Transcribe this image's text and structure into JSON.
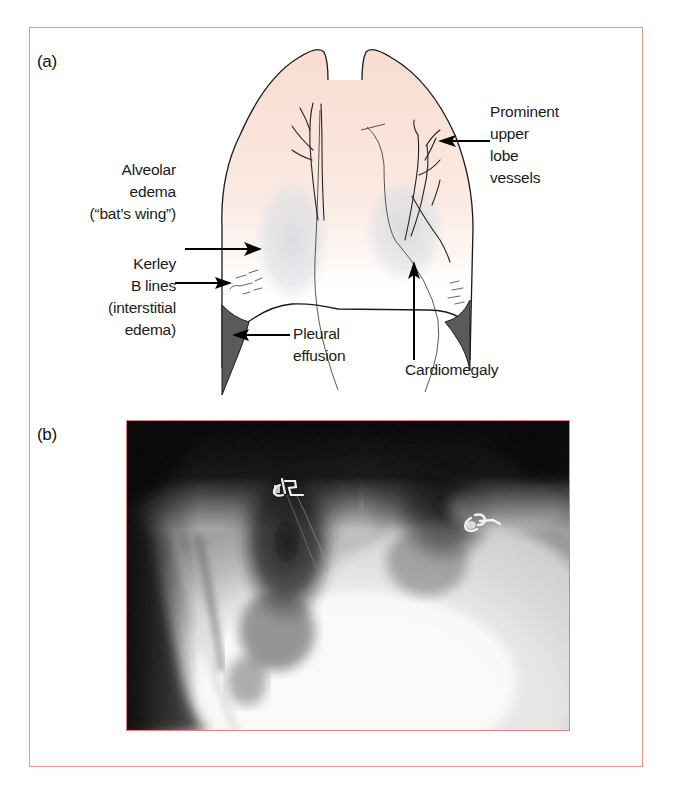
{
  "figure": {
    "frame_color": "#e69a8f",
    "panel_a": {
      "label": "(a)",
      "annotations": {
        "alveolar_edema": [
          "Alveolar",
          "edema",
          "(“bat’s wing”)"
        ],
        "kerley_b_lines": [
          "Kerley",
          "B lines",
          "(interstitial",
          "edema)"
        ],
        "pleural_effusion": [
          "Pleural",
          "effusion"
        ],
        "cardiomegaly": [
          "Cardiomegaly"
        ],
        "upper_lobe_vessels": [
          "Prominent",
          "upper",
          "lobe",
          "vessels"
        ]
      }
    },
    "panel_b": {
      "label": "(b)",
      "image_description": "Chest X-ray showing pulmonary edema with cardiomegaly"
    }
  }
}
